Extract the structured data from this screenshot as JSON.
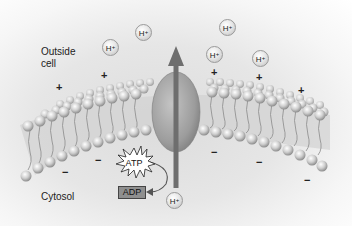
{
  "diagram": {
    "type": "proton-pump-membrane",
    "labels": {
      "outside": "Outside\ncell",
      "outside_line1": "Outside",
      "outside_line2": "cell",
      "inside": "Cytosol"
    },
    "molecules": {
      "atp": "ATP",
      "adp": "ADP"
    },
    "ions": [
      {
        "symbol": "H",
        "charge": "+",
        "x": 102,
        "y": 39
      },
      {
        "symbol": "H",
        "charge": "+",
        "x": 135,
        "y": 24
      },
      {
        "symbol": "H",
        "charge": "+",
        "x": 219,
        "y": 19
      },
      {
        "symbol": "H",
        "charge": "+",
        "x": 206,
        "y": 46
      },
      {
        "symbol": "H",
        "charge": "+",
        "x": 252,
        "y": 50
      },
      {
        "symbol": "H",
        "charge": "+",
        "x": 166,
        "y": 165
      }
    ],
    "charges_outside": [
      "+",
      "+",
      "+",
      "+",
      "+",
      "+"
    ],
    "charges_inside": [
      "−",
      "−",
      "−",
      "−",
      "−",
      "−"
    ],
    "colors": {
      "phospholipid_head": "#b8b8b8",
      "protein": "#9a9a9a",
      "arrow": "#6e6e6e",
      "adp_box": "#8f8f8f"
    }
  }
}
